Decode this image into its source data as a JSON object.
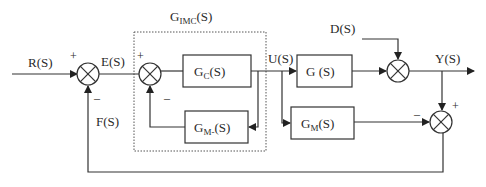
{
  "diagram": {
    "type": "block-diagram",
    "imc_group_label": {
      "main": "G",
      "sub": "IMC",
      "tail": "(S)"
    },
    "signals": {
      "reference": "R(S)",
      "error": "E(S)",
      "control": "U(S)",
      "disturbance": "D(S)",
      "output": "Y(S)",
      "feedback": "F(S)"
    },
    "blocks": {
      "controller": {
        "main": "G",
        "sub": "C",
        "tail": "(S)"
      },
      "inner_model": {
        "main": "G",
        "sub": "M-",
        "tail": "(S)"
      },
      "plant": {
        "label": "G (S)"
      },
      "model": {
        "main": "G",
        "sub": "M",
        "tail": "(S)"
      }
    },
    "signs": {
      "sum1_top": "+",
      "sum1_bottom": "–",
      "sum2_top": "+",
      "sum2_bottom": "–",
      "sum4_left": "–",
      "sum4_top": "+"
    }
  }
}
